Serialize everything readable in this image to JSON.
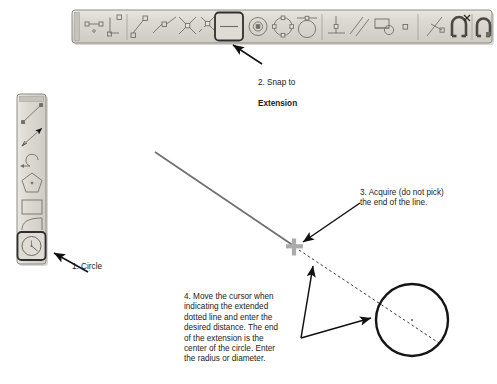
{
  "app": {
    "title": "AutoCAD object snap extension tutorial diagram",
    "background_color": "#ffffff",
    "toolbar_face_color": "#d6d4cd",
    "toolbar_border_color": "#9a978f",
    "icon_color": "#6e6b66",
    "highlight_border_color": "#333333",
    "annotation_color": "#1b1b1b",
    "geometry_line_color": "#6b6b6b",
    "marker_color": "#a8a8a8",
    "circle_color": "#1a1a1a"
  },
  "horizontal_toolbar": {
    "name": "Object Snap toolbar",
    "x": 72,
    "y": 10,
    "width": 420,
    "height": 33,
    "buttons": [
      {
        "icon": "snap-temporary-tracking-point-icon",
        "label": "Temporary Tracking Point",
        "highlighted": false
      },
      {
        "icon": "snap-from-icon",
        "label": "Snap From",
        "highlighted": false
      },
      {
        "icon": "snap-endpoint-icon",
        "label": "Snap to Endpoint",
        "highlighted": false
      },
      {
        "icon": "snap-midpoint-icon",
        "label": "Snap to Midpoint",
        "highlighted": false
      },
      {
        "icon": "snap-intersection-icon",
        "label": "Snap to Intersection",
        "highlighted": false
      },
      {
        "icon": "snap-apparent-intersect-icon",
        "label": "Snap to Apparent Intersect",
        "highlighted": false
      },
      {
        "icon": "snap-extension-icon",
        "label": "Snap to Extension",
        "highlighted": true
      },
      {
        "icon": "snap-center-icon",
        "label": "Snap to Center",
        "highlighted": false
      },
      {
        "icon": "snap-quadrant-icon",
        "label": "Snap to Quadrant",
        "highlighted": false
      },
      {
        "icon": "snap-tangent-icon",
        "label": "Snap to Tangent",
        "highlighted": false
      },
      {
        "icon": "snap-perpendicular-icon",
        "label": "Snap to Perpendicular",
        "highlighted": false
      },
      {
        "icon": "snap-parallel-icon",
        "label": "Snap to Parallel",
        "highlighted": false
      },
      {
        "icon": "snap-insert-icon",
        "label": "Snap to Insert",
        "highlighted": false
      },
      {
        "icon": "snap-node-icon",
        "label": "Snap to Node",
        "highlighted": false
      },
      {
        "icon": "snap-nearest-icon",
        "label": "Snap to Nearest",
        "highlighted": false
      },
      {
        "icon": "snap-none-icon",
        "label": "Snap to None",
        "highlighted": false
      },
      {
        "icon": "osnap-settings-icon",
        "label": "Object Snap Settings",
        "highlighted": false
      }
    ]
  },
  "vertical_toolbar": {
    "name": "Draw toolbar",
    "x": 17,
    "y": 94,
    "width": 29,
    "height": 170,
    "buttons": [
      {
        "icon": "draw-line-icon",
        "label": "Line",
        "highlighted": false
      },
      {
        "icon": "draw-construction-line-icon",
        "label": "Construction Line",
        "highlighted": false
      },
      {
        "icon": "draw-arc-icon",
        "label": "Arc",
        "highlighted": false
      },
      {
        "icon": "draw-polygon-icon",
        "label": "Polygon",
        "highlighted": false
      },
      {
        "icon": "draw-rectangle-icon",
        "label": "Rectangle",
        "highlighted": false
      },
      {
        "icon": "draw-spline-icon",
        "label": "Spline",
        "highlighted": false
      },
      {
        "icon": "draw-circle-icon",
        "label": "Circle",
        "highlighted": true
      }
    ]
  },
  "annotations": {
    "callout1": {
      "text": "1. Circle"
    },
    "callout2": {
      "line1": "2. Snap to",
      "line2": "Extension"
    },
    "callout3": {
      "text": "3. Acquire (do not pick)\nthe end of the line."
    },
    "callout4": {
      "text": "4. Move the cursor when\nindicating the extended\ndotted line and enter the\ndesired distance. The end\nof the extension is the\ncenter of the circle. Enter\nthe radius or diameter."
    }
  },
  "drawing": {
    "line": {
      "name": "solid-line",
      "x1": 155,
      "y1": 152,
      "x2": 294,
      "y2": 246
    },
    "extension_marker": {
      "name": "extension-snap-marker",
      "x": 294,
      "y": 246,
      "size": 17
    },
    "dotted_extension": {
      "name": "dotted-extension-line",
      "x1": 296,
      "y1": 249,
      "x2": 440,
      "y2": 343
    },
    "circle": {
      "name": "result-circle",
      "cx": 412,
      "cy": 320,
      "r": 36
    },
    "center_dot": {
      "name": "circle-center-dot",
      "cx": 412,
      "cy": 320,
      "r": 1.2
    }
  },
  "leader_arrows": [
    {
      "name": "leader-to-circle-button",
      "from_x": 88,
      "from_y": 272,
      "to_x": 52,
      "to_y": 252
    },
    {
      "name": "leader-to-extension-button",
      "from_x": 262,
      "from_y": 64,
      "to_x": 232,
      "to_y": 44
    },
    {
      "name": "leader-to-line-end",
      "from_x": 358,
      "from_y": 204,
      "to_x": 302,
      "to_y": 243
    },
    {
      "name": "leader-callout4-to-marker",
      "from_x": 302,
      "from_y": 337,
      "to_x": 313,
      "to_y": 266
    },
    {
      "name": "leader-callout4-to-circle",
      "from_x": 302,
      "from_y": 337,
      "to_x": 372,
      "to_y": 318
    }
  ]
}
